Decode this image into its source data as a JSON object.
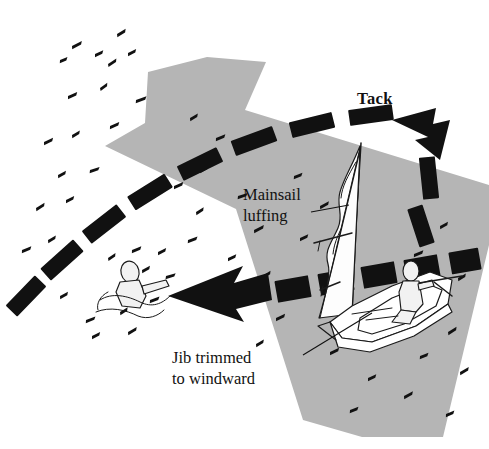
{
  "figure": {
    "width": 489,
    "height": 449,
    "background_color": "#ffffff"
  },
  "colors": {
    "ink": "#111111",
    "wind_band_gray": "#b5b5b5",
    "paper_white": "#ffffff",
    "sail_white": "#fdfdfd",
    "figure_gray": "#f2f2f2"
  },
  "labels": {
    "tack": {
      "text": "Tack",
      "style": "bold",
      "x": 357,
      "y": 104
    },
    "mainsail_luffing": {
      "line1": "Mainsail",
      "line2": "luffing",
      "style": "plain",
      "x": 243,
      "y": 200
    },
    "jib_trimmed": {
      "line1": "Jib trimmed",
      "line2": "to windward",
      "style": "plain",
      "x": 172,
      "y": 363
    }
  },
  "annotations": {
    "mainsail_leader": {
      "name": "leader-line-mainsail",
      "from_x": 311,
      "from_y": 212,
      "to_x": 349,
      "to_y": 205,
      "description": "short horizontal leader from Mainsail luffing text to the luffing mainsail"
    },
    "jib_leader": {
      "name": "leader-line-jib",
      "from_x": 303,
      "from_y": 355,
      "to_x": 372,
      "to_y": 313,
      "description": "diagonal leader from Jib trimmed to windward text up to the jib foot"
    }
  },
  "wind_band": {
    "name": "wind-direction-arrow",
    "color": "#b5b5b5",
    "direction": "from lower-right to upper-left",
    "description": "broad gray arrow band showing true wind flowing up and to the left across the scene"
  },
  "boat_path": {
    "name": "dashed-boat-track",
    "style": "thick black dashes",
    "description": "dashed curving track sweeping from the boat up and around the tack, then back down-left toward the person in the water",
    "arrowheads": [
      {
        "name": "tack-arrowhead",
        "points": "up-left",
        "x": 430,
        "y": 130
      },
      {
        "name": "return-arrowhead",
        "points": "left",
        "x": 175,
        "y": 290
      }
    ],
    "dash_count_upper": 7,
    "dash_count_lower": 6
  },
  "boat": {
    "name": "sailing-dinghy",
    "x": 320,
    "y": 140,
    "parts": [
      "mast",
      "mainsail-luffing",
      "jib-backed-to-windward",
      "boom",
      "hull",
      "tiller",
      "helmsman"
    ]
  },
  "swimmer": {
    "name": "person-in-water",
    "x": 115,
    "y": 265,
    "description": "man overboard floating in the water with splash marks around"
  },
  "water_marks": {
    "name": "wave-tick-marks",
    "count": 54,
    "description": "small black comma-like ticks scattered over the scene representing wavelets"
  }
}
